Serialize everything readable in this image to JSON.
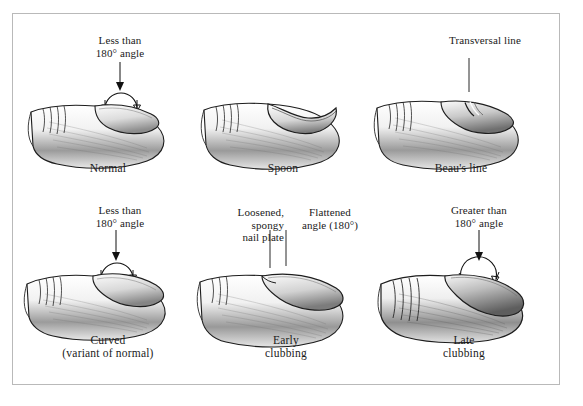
{
  "figure": {
    "type": "medical-illustration",
    "background_color": "#ffffff",
    "border_color": "#b9b9b9",
    "ink_color": "#111111"
  },
  "panels": [
    {
      "id": "normal",
      "caption": "Normal",
      "caption2": "",
      "annotations": [
        {
          "id": "angle",
          "line1": "Less than",
          "line2": "180° angle",
          "marker": "arc-arrows"
        }
      ]
    },
    {
      "id": "spoon",
      "caption": "Spoon",
      "caption2": "",
      "annotations": []
    },
    {
      "id": "beaus-line",
      "caption": "Beau's line",
      "caption2": "",
      "annotations": [
        {
          "id": "transversal",
          "line1": "Transversal line",
          "line2": "",
          "marker": "leader"
        }
      ]
    },
    {
      "id": "curved",
      "caption": "Curved",
      "caption2": "(variant of normal)",
      "annotations": [
        {
          "id": "angle",
          "line1": "Less than",
          "line2": "180° angle",
          "marker": "arc-arrows"
        }
      ]
    },
    {
      "id": "early-clubbing",
      "caption": "Early",
      "caption2": "clubbing",
      "annotations": [
        {
          "id": "nail-plate",
          "line1": "Loosened,",
          "line2": "spongy",
          "line3": "nail plate",
          "marker": "leader"
        },
        {
          "id": "flat-angle",
          "line1": "Flattened",
          "line2": "angle (180°)",
          "marker": "leader"
        }
      ]
    },
    {
      "id": "late-clubbing",
      "caption": "Late",
      "caption2": "clubbing",
      "annotations": [
        {
          "id": "angle",
          "line1": "Greater than",
          "line2": "180° angle",
          "marker": "arc-arrows"
        }
      ]
    }
  ]
}
